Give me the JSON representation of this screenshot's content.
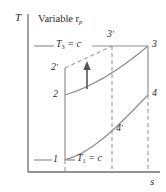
{
  "figure": {
    "type": "T-s thermodynamic cycle diagram",
    "title": "Variable r",
    "title_sub": "p",
    "background_color": "#ffffff",
    "line_color": "#808080",
    "axis_color": "#6e6e6e",
    "text_color": "#2b2b2b"
  },
  "axes": {
    "y_label": "T",
    "x_label": "s",
    "y_axis": {
      "x": 28,
      "y_top": 14,
      "y_bottom": 172
    },
    "x_axis": {
      "y": 172,
      "x_left": 28,
      "x_right": 160
    }
  },
  "isotherms": [
    {
      "name": "upper-isotherm",
      "label_main": "T",
      "label_sub": "3",
      "label_eq": " = c",
      "y": 46,
      "label_x": 56,
      "label_y": 40
    },
    {
      "name": "lower-isotherm",
      "label_main": "T",
      "label_sub": "1",
      "label_eq": " = c",
      "y": 160,
      "label_x": 76,
      "label_y": 154
    }
  ],
  "states": [
    {
      "id": "1",
      "label": "1",
      "prime": "",
      "x": 65,
      "y": 160,
      "label_x": 54,
      "label_y": 154
    },
    {
      "id": "2",
      "label": "2",
      "prime": "",
      "x": 65,
      "y": 95,
      "label_x": 54,
      "label_y": 89
    },
    {
      "id": "2p",
      "label": "2",
      "prime": "′",
      "x": 65,
      "y": 68,
      "label_x": 52,
      "label_y": 62
    },
    {
      "id": "3",
      "label": "3",
      "prime": "",
      "x": 148,
      "y": 46,
      "label_x": 152,
      "label_y": 40
    },
    {
      "id": "3p",
      "label": "3",
      "prime": "′",
      "x": 112,
      "y": 46,
      "label_x": 108,
      "label_y": 30
    },
    {
      "id": "4",
      "label": "4",
      "prime": "",
      "x": 148,
      "y": 95,
      "label_x": 152,
      "label_y": 89
    },
    {
      "id": "4p",
      "label": "4",
      "prime": "′",
      "x": 112,
      "y": 128,
      "label_x": 116,
      "label_y": 124
    }
  ],
  "curves": {
    "isobar_2_to_3": "M65,95 C90,88 120,68 148,46",
    "isobar_1_to_4": "M65,160 C95,152 125,118 148,95",
    "vertical_2p_2_1": "M65,68 L65,160",
    "vertical_1_dashed": "M65,160 L65,172",
    "vertical_3_4": "M148,46 L148,95",
    "vertical_4_dashed": "M148,95 L148,172",
    "dashed_2p_to_3p": "M65,68 L112,46",
    "dashed_vertical_3p": "M112,46 L112,172",
    "isotherm_tick_upper": "M34,46 L56,46",
    "isotherm_tick_upper_right": "M92,46 L148,46",
    "isotherm_tick_lower": "M34,160 L52,160",
    "isotherm_tick_lower_right": "M66,160 L74,160",
    "arrow_stem": "M87,88 L87,66"
  },
  "annotations": {
    "arrow": {
      "name": "upward-arrow",
      "x": 87,
      "y_tail": 88,
      "y_head": 64
    }
  }
}
